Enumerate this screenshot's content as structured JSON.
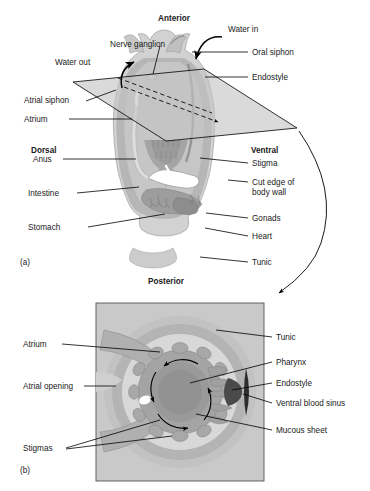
{
  "figure": {
    "panels": [
      {
        "id": "a",
        "caption": "(a)"
      },
      {
        "id": "b",
        "caption": "(b)"
      }
    ]
  },
  "panel_a": {
    "orientation": {
      "anterior": "Anterior",
      "posterior": "Posterior",
      "dorsal": "Dorsal",
      "ventral": "Ventral"
    },
    "labels_left": [
      {
        "name": "nerve-ganglion",
        "text": "Nerve ganglion"
      },
      {
        "name": "water-out",
        "text": "Water out"
      },
      {
        "name": "atrial-siphon",
        "text": "Atrial siphon"
      },
      {
        "name": "atrium",
        "text": "Atrium"
      },
      {
        "name": "anus",
        "text": "Anus"
      },
      {
        "name": "intestine",
        "text": "Intestine"
      },
      {
        "name": "stomach",
        "text": "Stomach"
      }
    ],
    "labels_right": [
      {
        "name": "water-in",
        "text": "Water in"
      },
      {
        "name": "oral-siphon",
        "text": "Oral siphon"
      },
      {
        "name": "endostyle",
        "text": "Endostyle"
      },
      {
        "name": "stigma",
        "text": "Stigma"
      },
      {
        "name": "cut-edge-of-body-wall",
        "text": "Cut edge of\nbody wall"
      },
      {
        "name": "gonads",
        "text": "Gonads"
      },
      {
        "name": "heart",
        "text": "Heart"
      },
      {
        "name": "tunic",
        "text": "Tunic"
      }
    ]
  },
  "panel_b": {
    "labels_left": [
      {
        "name": "atrium",
        "text": "Atrium"
      },
      {
        "name": "atrial-opening",
        "text": "Atrial opening"
      },
      {
        "name": "stigmas",
        "text": "Stigmas"
      }
    ],
    "labels_right": [
      {
        "name": "tunic",
        "text": "Tunic"
      },
      {
        "name": "pharynx",
        "text": "Pharynx"
      },
      {
        "name": "endostyle",
        "text": "Endostyle"
      },
      {
        "name": "ventral-blood-sinus",
        "text": "Ventral blood sinus"
      },
      {
        "name": "mucous-sheet",
        "text": "Mucous sheet"
      }
    ]
  },
  "colors": {
    "line": "#000000",
    "text": "#1a1a1a",
    "tunic_outer": "#d2d2d2",
    "tunic_mid": "#bdbdbd",
    "body_wall": "#a9a9a9",
    "atrium_light": "#dcdcdc",
    "pharynx": "#9a9a9a",
    "pharynx_dark": "#8a8a8a",
    "plane": "#c4c4c4",
    "panel_bg": "#c9c9c9",
    "dark_sinus": "#4a4a4a",
    "highlight": "#ffffff"
  }
}
